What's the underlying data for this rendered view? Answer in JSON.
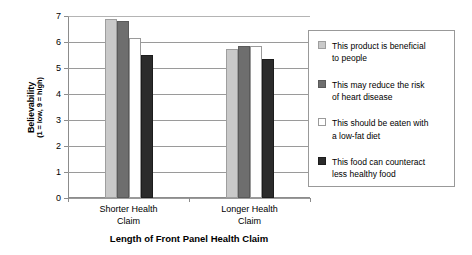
{
  "chart_data": {
    "type": "bar",
    "title": "",
    "xlabel": "Length of Front Panel Health Claim",
    "ylabel": "Believability",
    "ylabel_sub": "(1 = low, 9 = high)",
    "ylim": [
      0,
      7
    ],
    "yticks": [
      0,
      1,
      2,
      3,
      4,
      5,
      6,
      7
    ],
    "grid": true,
    "legend_position": "right",
    "categories": [
      "Shorter Health Claim",
      "Longer Health Claim"
    ],
    "series": [
      {
        "name": "This product is beneficial to people",
        "color": "#c9c9c9",
        "values": [
          6.9,
          5.75
        ]
      },
      {
        "name": "This may reduce the risk of heart disease",
        "color": "#6e6e6e",
        "values": [
          6.8,
          5.85
        ]
      },
      {
        "name": "This should be eaten with a low-fat diet",
        "color": "#ffffff",
        "values": [
          6.15,
          5.85
        ]
      },
      {
        "name": "This food can counteract less healthy food",
        "color": "#2b2b2b",
        "values": [
          5.5,
          5.35
        ]
      }
    ]
  },
  "axis": {
    "y_tick_labels": [
      "7",
      "6",
      "5",
      "4",
      "3",
      "2",
      "1",
      "0"
    ],
    "y_title_line1": "Believability",
    "y_title_line2": "(1 = low, 9 = high)",
    "x_title": "Length of Front Panel Health Claim",
    "category_labels": [
      "Shorter Health\nClaim",
      "Longer Health\nClaim"
    ]
  },
  "legend": {
    "entries": [
      {
        "label_line1": "This product is beneficial",
        "label_line2": "to people"
      },
      {
        "label_line1": "This may reduce the risk",
        "label_line2": "of heart disease"
      },
      {
        "label_line1": "This should be eaten with",
        "label_line2": "a low-fat diet"
      },
      {
        "label_line1": "This food can counteract",
        "label_line2": "less healthy food"
      }
    ]
  }
}
